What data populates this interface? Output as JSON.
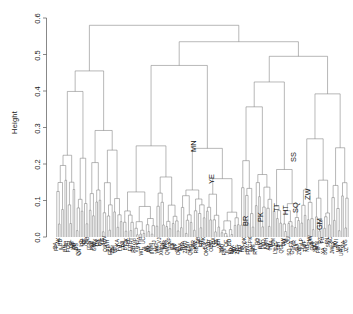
{
  "plot": {
    "type": "dendrogram",
    "ylabel": "Height",
    "title": "",
    "line_color": "#7d7d7d",
    "text_color": "#111111"
  },
  "axis": {
    "ticks": [
      "0.0",
      "0.1",
      "0.2",
      "0.3",
      "0.4",
      "0.5",
      "0.6"
    ],
    "min": 0.0,
    "max": 0.6
  },
  "chart_data": {
    "type": "dendrogram",
    "title": "",
    "xlabel": "",
    "ylabel": "Height",
    "ylim": [
      0.0,
      0.6
    ],
    "grid": false,
    "legend": "none",
    "root_height": 0.58,
    "cluster_heights": [
      0.58,
      0.535,
      0.495,
      0.47,
      0.455,
      0.405,
      0.39,
      0.388,
      0.387,
      0.355,
      0.335,
      0.33,
      0.325,
      0.32,
      0.295,
      0.29,
      0.288,
      0.285,
      0.28,
      0.278,
      0.232,
      0.23,
      0.228,
      0.215,
      0.205,
      0.19,
      0.175,
      0.172,
      0.168,
      0.155,
      0.152,
      0.13,
      0.128,
      0.118,
      0.115,
      0.105,
      0.1,
      0.088,
      0.082,
      0.075,
      0.07,
      0.065,
      0.06,
      0.055,
      0.05,
      0.045,
      0.04,
      0.035,
      0.03,
      0.025,
      0.02,
      0.015,
      0.012,
      0.01
    ],
    "visible_inner_labels": [
      "MN",
      "YE",
      "SS",
      "ZW",
      "SQ",
      "HT",
      "TT",
      "PK",
      "BR",
      "GM"
    ],
    "visible_leaf_labels": [
      "OA",
      "BN",
      "QB",
      "FF",
      "GM",
      "AHV",
      "TM",
      "PA",
      "RH",
      "UC",
      "IIN",
      "ZN",
      "CJ",
      "RG",
      "MV",
      "RT",
      "OBC",
      "NN",
      "BR",
      "YE",
      "GPK",
      "PY",
      "HT",
      "TT",
      "SQ",
      "ZW",
      "GM",
      "PB",
      "SS",
      "MN"
    ],
    "n_leaves": 180,
    "note": "Hierarchical clustering dendrogram; leaf labels are rotated 90 degrees and heavily overplotted at the baseline."
  }
}
